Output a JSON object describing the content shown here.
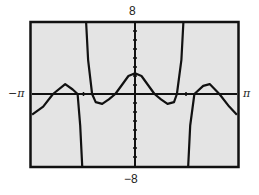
{
  "chart_data": {
    "type": "line",
    "title": "",
    "xlabel": "",
    "ylabel": "",
    "xlim": [
      -3.1416,
      3.1416
    ],
    "ylim": [
      -8,
      8
    ],
    "x_tick_labels": {
      "min": "−π",
      "max": "π"
    },
    "y_tick_labels": {
      "max": "8",
      "min": "-8"
    },
    "y_ticks_every": 1,
    "x_ticks": [
      -1.5708,
      1.5708
    ],
    "grid": false,
    "legend": null,
    "series": [
      {
        "name": "curve-left-branch",
        "x": [
          -3.14,
          -2.8,
          -2.5,
          -2.13,
          -1.9,
          -1.75,
          -1.67,
          -1.61
        ],
        "y": [
          -2.3,
          -1.4,
          0,
          1.1,
          0.5,
          0,
          -3.5,
          -8
        ]
      },
      {
        "name": "curve-middle-branch",
        "x": [
          -1.49,
          -1.43,
          -1.31,
          -1.2,
          -1.0,
          -0.8,
          -0.6,
          -0.4,
          -0.2,
          0,
          0.2,
          0.4,
          0.6,
          0.8,
          1.0,
          1.2,
          1.29,
          1.43,
          1.49
        ],
        "y": [
          8,
          3.8,
          0,
          -0.9,
          -1.1,
          -0.6,
          0,
          1.0,
          2.0,
          2.3,
          2.0,
          1.0,
          0,
          -0.6,
          -1.1,
          -0.9,
          0,
          3.8,
          8
        ]
      },
      {
        "name": "curve-right-branch",
        "x": [
          1.64,
          1.7,
          1.83,
          2.1,
          2.3,
          2.6,
          2.9,
          3.14
        ],
        "y": [
          -8,
          -3.5,
          0,
          0.9,
          1.1,
          0,
          -1.4,
          -2.3
        ]
      }
    ]
  },
  "labels": {
    "y_top": "8",
    "y_bottom": "−8",
    "x_left": "−π",
    "x_right": "π"
  },
  "colors": {
    "plot_background": "#e4e4e4",
    "curve": "#111111",
    "frame": "#111111"
  }
}
